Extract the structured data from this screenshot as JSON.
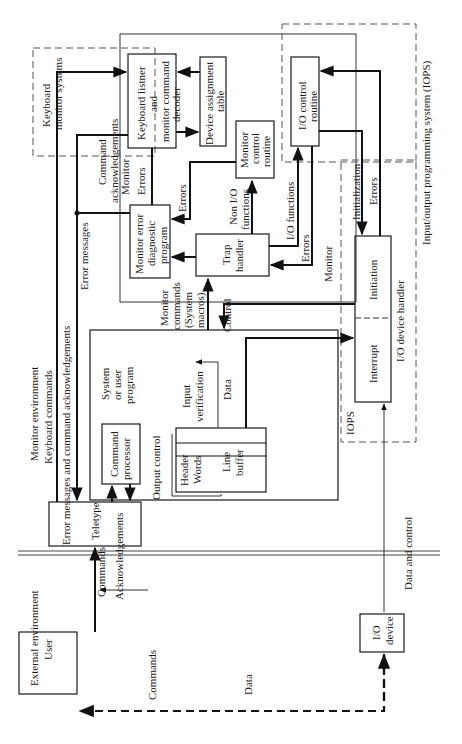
{
  "regions": {
    "external": "External environment",
    "monitor": "Monitor environment",
    "keyboard_monitor": [
      "Keyboard",
      "monitor systems"
    ],
    "iops_full": "Input/output programming system (IOPS)",
    "iops_short": "IOPS"
  },
  "blocks": {
    "user": "User",
    "teletype": "Teletype",
    "io_device": [
      "I/O",
      "device"
    ],
    "keyboard_listener": [
      "Keyboard listner",
      "and",
      "monitor command",
      "decoder"
    ],
    "device_table": [
      "Device assignment",
      "table"
    ],
    "monitor_control": [
      "Monitor",
      "control",
      "routine"
    ],
    "io_control": [
      "I/O control",
      "routine"
    ],
    "error_diag": [
      "Monitor error",
      "diagnostic",
      "program"
    ],
    "trap_handler": [
      "Trap",
      "handler"
    ],
    "system_program": [
      "System",
      "or user",
      "program"
    ],
    "command_processor": [
      "Command",
      "processor"
    ],
    "line_buffer": [
      "Line",
      "buffer"
    ],
    "header": "Header",
    "words": "Words",
    "initiation": "Initiation",
    "interrupt": "Interrupt",
    "io_device_handler": "I/O device handler"
  },
  "labels": {
    "commands_user": "Commands",
    "data_user": "Data",
    "keyboard_commands": "Keyboard commands",
    "error_ack": "Error messages and command acknowledgements",
    "error_messages": "Error messages",
    "command_ack": [
      "Command",
      "acknowledgements"
    ],
    "commands": "Commands",
    "acknowledgements": "Acknowledgements",
    "monitor": "Monitor",
    "errors1": "Errors",
    "errors2": "Errors",
    "non_io": [
      "Non I/O",
      "functions"
    ],
    "io_functions": "I/O functions",
    "errors3": "Errors",
    "monitor2": "Monitor",
    "initialization": "Initialization",
    "errors4": "Errors",
    "monitor_commands": [
      "Monitor",
      "commands",
      "(System",
      "macros)"
    ],
    "control": "Control",
    "data": "Data",
    "input_verification": [
      "Input",
      "verification"
    ],
    "output_control": "Output control",
    "data_and_control": "Data and control"
  }
}
